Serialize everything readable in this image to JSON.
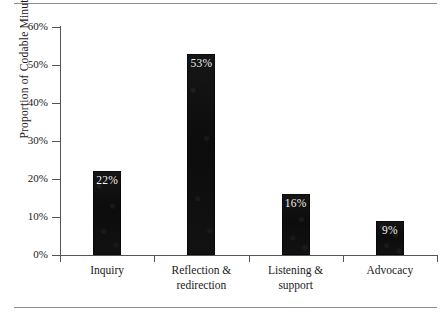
{
  "figure": {
    "top_rule": "horizontal-rule",
    "bottom_rule": "horizontal-rule"
  },
  "chart_data": {
    "type": "bar",
    "title": "",
    "xlabel": "",
    "ylabel": "Proportion of Codable Minutes",
    "ylim": [
      0,
      60
    ],
    "grid": false,
    "legend": "none",
    "yticks": [
      "0%",
      "10%",
      "20%",
      "30%",
      "40%",
      "50%",
      "60%"
    ],
    "ytick_values": [
      0,
      10,
      20,
      30,
      40,
      50,
      60
    ],
    "categories": [
      "Inquiry",
      "Reflection & redirection",
      "Listening & support",
      "Advocacy"
    ],
    "category_lines": [
      [
        "Inquiry"
      ],
      [
        "Reflection &",
        "redirection"
      ],
      [
        "Listening &",
        "support"
      ],
      [
        "Advocacy"
      ]
    ],
    "values": [
      22,
      53,
      16,
      9
    ],
    "data_labels": [
      "22%",
      "53%",
      "16%",
      "9%"
    ],
    "bar_color": "#101010",
    "label_color": "#f2f2f2",
    "axis_color": "#555555"
  }
}
